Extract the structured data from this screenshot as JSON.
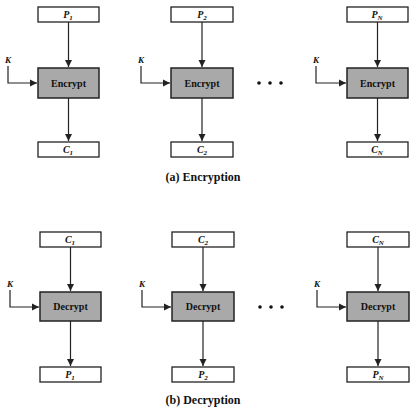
{
  "diagram": {
    "encryption": {
      "caption": "(a) Encryption",
      "op_label": "Encrypt",
      "key_label": "K",
      "blocks": [
        {
          "input": "P",
          "input_sub": "1",
          "output": "C",
          "output_sub": "1"
        },
        {
          "input": "P",
          "input_sub": "2",
          "output": "C",
          "output_sub": "2"
        },
        {
          "input": "P",
          "input_sub": "N",
          "output": "C",
          "output_sub": "N"
        }
      ],
      "ellipsis": "• • •"
    },
    "decryption": {
      "caption": "(b) Decryption",
      "op_label": "Decrypt",
      "key_label": "K",
      "blocks": [
        {
          "input": "C",
          "input_sub": "1",
          "output": "P",
          "output_sub": "1"
        },
        {
          "input": "C",
          "input_sub": "2",
          "output": "P",
          "output_sub": "2"
        },
        {
          "input": "C",
          "input_sub": "N",
          "output": "P",
          "output_sub": "N"
        }
      ],
      "ellipsis": "• • •"
    },
    "colors": {
      "op_fill": "#a9a9a9",
      "stroke": "#222222",
      "background": "#ffffff"
    }
  }
}
